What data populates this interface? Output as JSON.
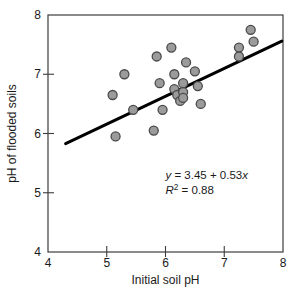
{
  "figure": {
    "background": "#ffffff",
    "width": 297,
    "height": 302
  },
  "chart_data": {
    "type": "scatter",
    "title": "",
    "xlabel": "Initial soil pH",
    "ylabel": "pH of flooded soils",
    "xlim": [
      4,
      8
    ],
    "ylim": [
      4,
      8
    ],
    "xticks": [
      4,
      5,
      6,
      7,
      8
    ],
    "yticks": [
      4,
      5,
      6,
      7,
      8
    ],
    "grid": false,
    "legend": null,
    "points": [
      [
        5.1,
        6.65
      ],
      [
        5.3,
        7.0
      ],
      [
        5.15,
        5.95
      ],
      [
        5.45,
        6.4
      ],
      [
        5.8,
        6.05
      ],
      [
        5.85,
        7.3
      ],
      [
        5.9,
        6.85
      ],
      [
        5.95,
        6.4
      ],
      [
        6.1,
        7.45
      ],
      [
        6.15,
        7.0
      ],
      [
        6.15,
        6.75
      ],
      [
        6.2,
        6.65
      ],
      [
        6.25,
        6.55
      ],
      [
        6.3,
        6.85
      ],
      [
        6.3,
        6.7
      ],
      [
        6.3,
        6.6
      ],
      [
        6.35,
        7.2
      ],
      [
        6.5,
        7.05
      ],
      [
        6.55,
        6.8
      ],
      [
        6.6,
        6.5
      ],
      [
        7.25,
        7.45
      ],
      [
        7.25,
        7.3
      ],
      [
        7.45,
        7.75
      ],
      [
        7.5,
        7.55
      ]
    ],
    "trend_line": {
      "x1": 4.3,
      "y1": 5.83,
      "x2": 7.98,
      "y2": 7.56
    },
    "annotation": {
      "equation_text": "y = 3.45 + 0.53x",
      "equation_parts": {
        "y_var": "y",
        "middle": " = 3.45 + 0.53",
        "x_var": "x"
      },
      "r_squared_text": "R² = 0.88",
      "r_squared_parts": {
        "r_var": "R",
        "exponent": "2",
        "value": " = 0.88"
      },
      "anchor_x": 6.0,
      "anchor_y": 5.23,
      "line_spacing_px": 15
    },
    "styles": {
      "point_fill": "#9b9b9b",
      "point_stroke": "#4a4a4a",
      "point_radius": 4.5,
      "point_stroke_width": 1.3,
      "trend_color": "#000000",
      "trend_width": 3,
      "frame_color": "#3c3c3c",
      "frame_width": 1.2,
      "tick_color": "#3c3c3c",
      "text_color": "#1a1a1a",
      "tick_font_size": 12,
      "label_font_size": 12,
      "annotation_font_size": 11.5
    },
    "layout": {
      "plot_left": 48,
      "plot_top": 15,
      "plot_right": 283,
      "plot_bottom": 252,
      "x_tick_label_baseline": 267,
      "x_title_baseline": 284,
      "y_tick_label_right": 41,
      "y_title_baseline_x": 16,
      "tick_cross_out": 5,
      "tick_cross_in": 6
    }
  }
}
